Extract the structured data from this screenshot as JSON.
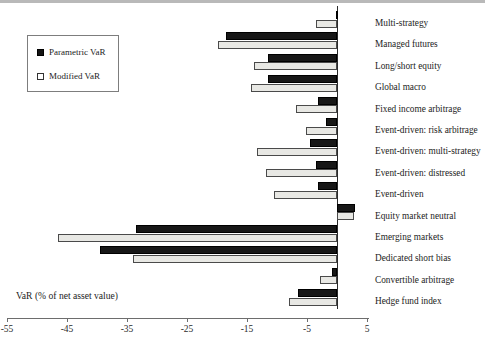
{
  "chart_data": {
    "type": "bar",
    "orientation": "horizontal",
    "title": "",
    "xlabel": "VaR (% of net asset value)",
    "ylabel": "",
    "xlim": [
      -55,
      5
    ],
    "xticks": [
      -55,
      -45,
      -35,
      -25,
      -15,
      -5,
      5
    ],
    "xtick_labels": [
      "-55",
      "-45",
      "-35",
      "-25",
      "-15",
      "-5",
      "5"
    ],
    "grid": false,
    "legend_position": "upper-left",
    "categories": [
      "Multi-strategy",
      "Managed futures",
      "Long/short equity",
      "Global macro",
      "Fixed income arbitrage",
      "Event-driven: risk arbitrage",
      "Event-driven: multi-strategy",
      "Event-driven: distressed",
      "Event-driven",
      "Equity market neutral",
      "Emerging markets",
      "Dedicated short bias",
      "Convertible arbitrage",
      "Hedge fund index"
    ],
    "series": [
      {
        "name": "Parametric VaR",
        "color": "#171717",
        "values": [
          -0.2,
          -18.5,
          -11.5,
          -11.5,
          -3.2,
          -1.8,
          -4.5,
          -3.5,
          -3.2,
          3.0,
          -33.5,
          -39.5,
          -0.8,
          -6.5
        ]
      },
      {
        "name": "Modified VaR",
        "color": "#e8e8e4",
        "values": [
          -3.5,
          -19.8,
          -13.8,
          -14.3,
          -6.8,
          -5.2,
          -13.3,
          -11.8,
          -10.5,
          2.8,
          -46.5,
          -34.0,
          -2.8,
          -8.0
        ]
      }
    ]
  },
  "legend": {
    "items": [
      {
        "label": "Parametric VaR",
        "swatch": "filled-black-square"
      },
      {
        "label": "Modified VaR",
        "swatch": "open-white-square"
      }
    ]
  },
  "axis": {
    "x_title": "VaR (% of net asset value)",
    "tick_labels": [
      "-55",
      "-45",
      "-35",
      "-25",
      "-15",
      "-5",
      "5"
    ]
  },
  "colors": {
    "parametric": "#171717",
    "modified": "#e8e8e4",
    "axis": "#2a2a2a",
    "text": "#1c1c1c"
  }
}
